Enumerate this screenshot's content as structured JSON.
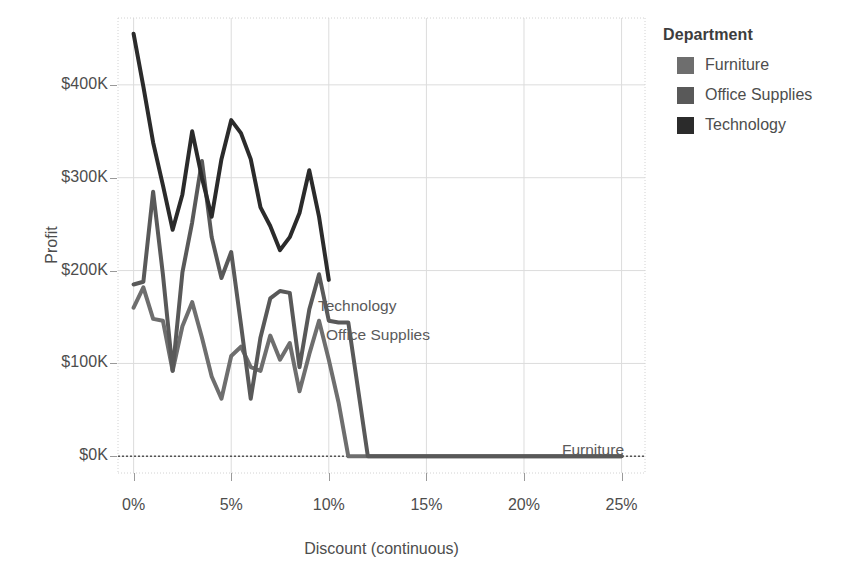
{
  "chart_data": {
    "type": "line",
    "title": "",
    "xlabel": "Discount (continuous)",
    "ylabel": "Profit",
    "xlim": [
      -0.8,
      26.2
    ],
    "ylim": [
      -18,
      472
    ],
    "grid": true,
    "x_ticks": [
      "0%",
      "5%",
      "10%",
      "15%",
      "20%",
      "25%"
    ],
    "x_tick_values": [
      0,
      5,
      10,
      15,
      20,
      25
    ],
    "y_ticks": [
      "$0K",
      "$100K",
      "$200K",
      "$300K",
      "$400K"
    ],
    "y_tick_values": [
      0,
      100,
      200,
      300,
      400
    ],
    "legend_title": "Department",
    "legend_position": "right",
    "zero_reference_line": 0,
    "series": [
      {
        "name": "Furniture",
        "color": "#6e6e6e",
        "inline_label": "Furniture",
        "x": [
          0,
          0.5,
          1,
          1.5,
          2,
          2.5,
          3,
          3.5,
          4,
          4.5,
          5,
          5.5,
          6,
          6.5,
          7,
          7.5,
          8,
          8.5,
          9,
          9.5,
          10,
          10.5,
          11,
          12,
          13,
          14,
          15,
          16,
          17,
          18,
          19,
          20,
          21,
          22,
          23,
          24,
          25
        ],
        "y": [
          160,
          182,
          148,
          146,
          92,
          140,
          166,
          128,
          86,
          62,
          108,
          118,
          96,
          92,
          130,
          104,
          122,
          70,
          110,
          146,
          104,
          58,
          0,
          0,
          0,
          0,
          0,
          0,
          0,
          0,
          0,
          0,
          0,
          0,
          0,
          0,
          0
        ]
      },
      {
        "name": "Office Supplies",
        "color": "#595959",
        "inline_label": "Office Supplies",
        "x": [
          0,
          0.5,
          1,
          1.5,
          2,
          2.5,
          3,
          3.5,
          4,
          4.5,
          5,
          5.5,
          6,
          6.5,
          7,
          7.5,
          8,
          8.5,
          9,
          9.5,
          10,
          10.5,
          11,
          12,
          13,
          14,
          15,
          16,
          17,
          18,
          19,
          20,
          21,
          22,
          23,
          24,
          25
        ],
        "y": [
          185,
          188,
          285,
          196,
          92,
          198,
          252,
          318,
          236,
          192,
          220,
          142,
          62,
          128,
          170,
          178,
          176,
          96,
          158,
          196,
          146,
          144,
          144,
          0,
          0,
          0,
          0,
          0,
          0,
          0,
          0,
          0,
          0,
          0,
          0,
          0,
          0
        ]
      },
      {
        "name": "Technology",
        "color": "#2b2b2b",
        "inline_label": "Technology",
        "x": [
          0,
          0.5,
          1,
          1.5,
          2,
          2.5,
          3,
          3.5,
          4,
          4.5,
          5,
          5.5,
          6,
          6.5,
          7,
          7.5,
          8,
          8.5,
          9,
          9.5,
          10
        ],
        "y": [
          455,
          398,
          338,
          292,
          244,
          282,
          350,
          300,
          258,
          320,
          362,
          348,
          320,
          268,
          248,
          222,
          236,
          262,
          308,
          258,
          190
        ]
      }
    ]
  },
  "legend": {
    "title": "Department",
    "items": [
      {
        "label": "Furniture",
        "color": "#6e6e6e"
      },
      {
        "label": "Office Supplies",
        "color": "#595959"
      },
      {
        "label": "Technology",
        "color": "#2b2b2b"
      }
    ]
  },
  "axes": {
    "x_title": "Discount (continuous)",
    "y_title": "Profit",
    "x_ticks": [
      "0%",
      "5%",
      "10%",
      "15%",
      "20%",
      "25%"
    ],
    "y_ticks": [
      "$400K",
      "$300K",
      "$200K",
      "$100K",
      "$0K"
    ]
  },
  "annotations": {
    "technology": "Technology",
    "office_supplies": "Office Supplies",
    "furniture": "Furniture"
  }
}
